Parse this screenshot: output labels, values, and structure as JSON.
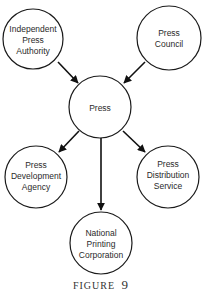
{
  "diagram": {
    "type": "hub-and-spoke",
    "nodes": [
      {
        "id": "independent-press-authority",
        "lines": [
          "Independent",
          "Press",
          "Authority"
        ]
      },
      {
        "id": "press-council",
        "lines": [
          "Press",
          "Council"
        ]
      },
      {
        "id": "press",
        "lines": [
          "Press"
        ]
      },
      {
        "id": "press-development-agency",
        "lines": [
          "Press",
          "Development",
          "Agency"
        ]
      },
      {
        "id": "press-distribution-service",
        "lines": [
          "Press",
          "Distribution",
          "Service"
        ]
      },
      {
        "id": "national-printing-corporation",
        "lines": [
          "National",
          "Printing",
          "Corporation"
        ]
      }
    ],
    "edges": [
      {
        "from": "independent-press-authority",
        "to": "press"
      },
      {
        "from": "press-council",
        "to": "press"
      },
      {
        "from": "press",
        "to": "press-development-agency"
      },
      {
        "from": "press",
        "to": "press-distribution-service"
      },
      {
        "from": "press",
        "to": "national-printing-corporation"
      }
    ]
  },
  "caption": {
    "word": "FIGURE",
    "number": "9"
  }
}
